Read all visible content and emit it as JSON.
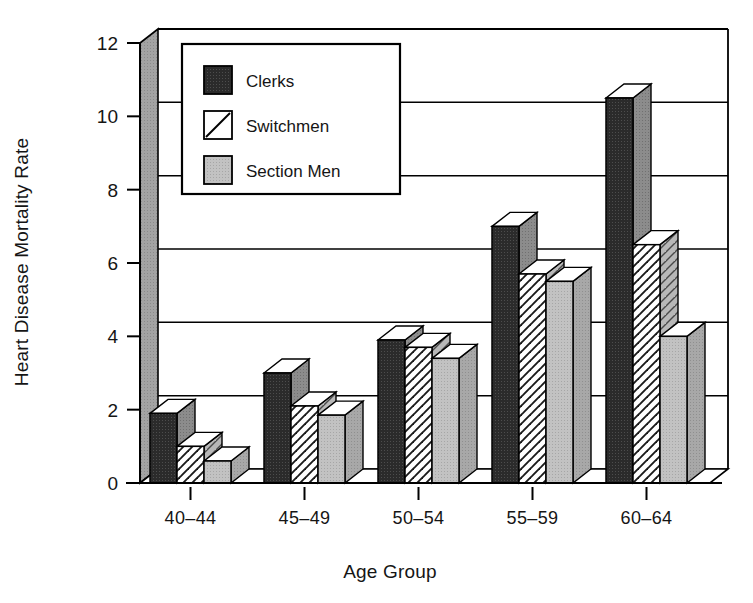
{
  "chart_data": {
    "type": "bar",
    "title": "",
    "subtitle": "",
    "xlabel": "Age  Group",
    "ylabel": "Heart Disease Mortality Rate",
    "categories": [
      "40–44",
      "45–49",
      "50–54",
      "55–59",
      "60–64"
    ],
    "series": [
      {
        "name": "Clerks",
        "values": [
          1.9,
          3.0,
          3.9,
          7.0,
          10.5
        ]
      },
      {
        "name": "Switchmen",
        "values": [
          1.0,
          2.1,
          3.7,
          5.7,
          6.5
        ]
      },
      {
        "name": "Section Men",
        "values": [
          0.6,
          1.85,
          3.4,
          5.5,
          4.0
        ]
      }
    ],
    "ylim": [
      0,
      12
    ],
    "yticks": [
      0,
      2,
      4,
      6,
      8,
      10,
      12
    ],
    "ytick_labels": [
      "0",
      "2",
      "4",
      "6",
      "8",
      "10",
      "12"
    ],
    "xlim_note": "categorical",
    "grid": "horizontal-only",
    "legend_position": "upper-left-inside",
    "style": "3d-bars-monochrome",
    "colors": {
      "clerks_fill": "#262626",
      "clerks_side": "#7a7a7a",
      "switchmen_fill": "#ffffff",
      "switchmen_side": "#b0b0b0",
      "section_men_fill": "#bdbdbd",
      "section_men_side": "#9a9a9a",
      "bar_top": "#ffffff",
      "axis_wall": "#9e9e9e",
      "outline": "#000000",
      "background": "#ffffff",
      "text": "#151515"
    },
    "patterns": {
      "clerks": "solid-dark",
      "switchmen": "forward-diagonal-hatch",
      "section_men": "solid-light-gray"
    }
  },
  "legend": {
    "items": [
      {
        "label": "Clerks",
        "swatch": "solid-dark-swatch"
      },
      {
        "label": "Switchmen",
        "swatch": "diagonal-hatch-swatch"
      },
      {
        "label": "Section Men",
        "swatch": "solid-gray-swatch"
      }
    ]
  },
  "axes": {
    "y_title": "Heart Disease Mortality Rate",
    "x_title": "Age  Group",
    "y_ticks": [
      "0",
      "2",
      "4",
      "6",
      "8",
      "10",
      "12"
    ],
    "x_ticks": [
      "40–44",
      "45–49",
      "50–54",
      "55–59",
      "60–64"
    ]
  }
}
